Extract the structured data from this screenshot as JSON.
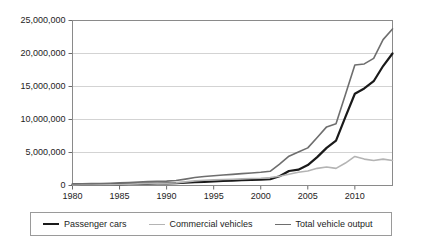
{
  "chart_data": {
    "type": "line",
    "title": "",
    "subtitle": "",
    "xlabel": "",
    "ylabel": "",
    "grid": true,
    "legend_position": "bottom",
    "xlim": [
      1980,
      2014
    ],
    "ylim": [
      0,
      25000000
    ],
    "y_ticks": [
      0,
      5000000,
      10000000,
      15000000,
      20000000,
      25000000
    ],
    "y_tick_labels": [
      "0",
      "5,000,000",
      "10,000,000",
      "15,000,000",
      "20,000,000",
      "25,000,000"
    ],
    "x_ticks": [
      1980,
      1985,
      1990,
      1995,
      2000,
      2005,
      2010
    ],
    "x_tick_labels": [
      "1980",
      "1985",
      "1990",
      "1995",
      "2000",
      "2005",
      "2010"
    ],
    "x": [
      1980,
      1981,
      1982,
      1983,
      1984,
      1985,
      1986,
      1987,
      1988,
      1989,
      1990,
      1991,
      1992,
      1993,
      1994,
      1995,
      1996,
      1997,
      1998,
      1999,
      2000,
      2001,
      2002,
      2003,
      2004,
      2005,
      2006,
      2007,
      2008,
      2009,
      2010,
      2011,
      2012,
      2013,
      2014
    ],
    "series": [
      {
        "name": "Passenger cars",
        "color": "#1a1a1a",
        "width": 2.2,
        "values": [
          150000,
          160000,
          170000,
          180000,
          200000,
          220000,
          240000,
          260000,
          290000,
          300000,
          310000,
          350000,
          420000,
          500000,
          560000,
          620000,
          680000,
          740000,
          800000,
          850000,
          900000,
          950000,
          1400000,
          2200000,
          2400000,
          3100000,
          4300000,
          5700000,
          6800000,
          10400000,
          13900000,
          14700000,
          15800000,
          18100000,
          20000000
        ]
      },
      {
        "name": "Commercial vehicles",
        "color": "#b4b4b4",
        "width": 1.6,
        "values": [
          100000,
          110000,
          120000,
          130000,
          150000,
          190000,
          210000,
          250000,
          300000,
          320000,
          350000,
          400000,
          550000,
          700000,
          800000,
          850000,
          900000,
          950000,
          1000000,
          1050000,
          1100000,
          1200000,
          1400000,
          1700000,
          2000000,
          2200000,
          2600000,
          2800000,
          2600000,
          3400000,
          4400000,
          4000000,
          3800000,
          4000000,
          3800000
        ]
      },
      {
        "name": "Total vehicle output",
        "color": "#6e6e6e",
        "width": 1.6,
        "values": [
          250000,
          270000,
          290000,
          310000,
          350000,
          410000,
          450000,
          510000,
          590000,
          620000,
          660000,
          750000,
          970000,
          1200000,
          1360000,
          1470000,
          1580000,
          1690000,
          1800000,
          1900000,
          2000000,
          2150000,
          3250000,
          4440000,
          5070000,
          5700000,
          7280000,
          8880000,
          9340000,
          13790000,
          18260000,
          18420000,
          19270000,
          22100000,
          23720000
        ]
      }
    ]
  }
}
